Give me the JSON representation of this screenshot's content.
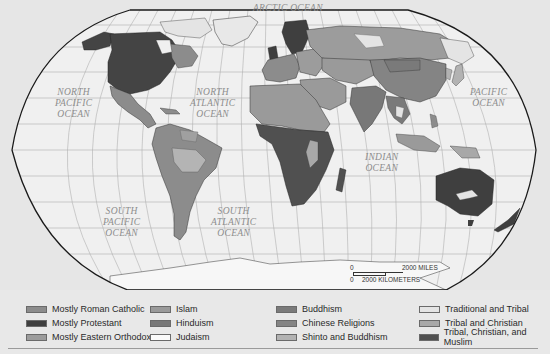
{
  "map": {
    "title_hidden": "World Religions",
    "ocean_labels": [
      {
        "id": "arctic",
        "text": "ARCTIC OCEAN",
        "x": 255,
        "y": 3
      },
      {
        "id": "north-pacific",
        "text": "NORTH\nPACIFIC\nOCEAN",
        "x": 55,
        "y": 87
      },
      {
        "id": "north-atlantic",
        "text": "NORTH\nATLANTIC\nOCEAN",
        "x": 190,
        "y": 87
      },
      {
        "id": "pacific-east",
        "text": "PACIFIC\nOCEAN",
        "x": 470,
        "y": 87
      },
      {
        "id": "indian",
        "text": "INDIAN\nOCEAN",
        "x": 360,
        "y": 152
      },
      {
        "id": "south-pacific",
        "text": "SOUTH\nPACIFIC\nOCEAN",
        "x": 103,
        "y": 206
      },
      {
        "id": "south-atlantic",
        "text": "SOUTH\nATLANTIC\nOCEAN",
        "x": 210,
        "y": 206
      }
    ],
    "scale_bar": {
      "miles_zero": "0",
      "miles_label": "2000 MILES",
      "km_zero": "0",
      "km_label": "2000 KILOMETERS"
    }
  },
  "legend": {
    "columns": [
      {
        "items": [
          {
            "label": "Mostly Roman Catholic",
            "color": "#8c8c8c"
          },
          {
            "label": "Mostly Protestant",
            "color": "#3f3f3f"
          },
          {
            "label": "Mostly Eastern Orthodox",
            "color": "#9c9c9c"
          }
        ]
      },
      {
        "items": [
          {
            "label": "Islam",
            "color": "#9a9a9a"
          },
          {
            "label": "Hinduism",
            "color": "#787878"
          },
          {
            "label": "Judaism",
            "color": "#fafafa"
          }
        ]
      },
      {
        "items": [
          {
            "label": "Buddhism",
            "color": "#7a7a7a"
          },
          {
            "label": "Chinese Religions",
            "color": "#848484"
          },
          {
            "label": "Shinto and Buddhism",
            "color": "#b2b2b2"
          }
        ]
      },
      {
        "items": [
          {
            "label": "Traditional and Tribal",
            "color": "#e4e4e4"
          },
          {
            "label": "Tribal and Christian",
            "color": "#a8a8a8"
          },
          {
            "label": "Tribal, Christian, and Muslim",
            "color": "#505050"
          }
        ]
      }
    ]
  },
  "colors": {
    "background": "#e6e6e6",
    "ocean": "#f0f0f0",
    "outline": "#1a1a1a",
    "graticule": "#a8a8a8",
    "antarctica": "#f7f7f7"
  }
}
